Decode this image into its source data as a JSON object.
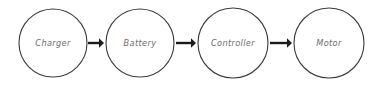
{
  "diagram": {
    "style": "hand-drawn sketch",
    "background_color": "#ffffff",
    "node_stroke_color": "#3a3a3a",
    "node_fill_color": "#ffffff",
    "label_color": "#6d6d6d",
    "arrow_color": "#1c1c1c",
    "nodes": [
      {
        "id": "charger",
        "label": "Charger",
        "cx": 53,
        "cy": 43,
        "r": 34
      },
      {
        "id": "battery",
        "label": "Battery",
        "cx": 140,
        "cy": 43,
        "r": 34
      },
      {
        "id": "controller",
        "label": "Controller",
        "cx": 233,
        "cy": 43,
        "r": 35
      },
      {
        "id": "motor",
        "label": "Motor",
        "cx": 329,
        "cy": 43,
        "r": 35
      }
    ],
    "edges": [
      {
        "id": "charger-to-battery",
        "from": "charger",
        "to": "battery",
        "x1": 88,
        "x2": 104,
        "y": 43,
        "arrow": "right"
      },
      {
        "id": "battery-to-controller",
        "from": "battery",
        "to": "controller",
        "x1": 176,
        "x2": 196,
        "y": 43,
        "arrow": "right"
      },
      {
        "id": "controller-to-motor",
        "from": "controller",
        "to": "motor",
        "x1": 270,
        "x2": 292,
        "y": 43,
        "arrow": "right"
      }
    ]
  }
}
